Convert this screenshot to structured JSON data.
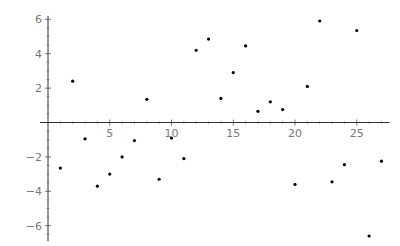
{
  "chart_data": {
    "type": "scatter",
    "title": "",
    "xlabel": "",
    "ylabel": "",
    "xlim": [
      0,
      27.5
    ],
    "ylim": [
      -6.9,
      6.2
    ],
    "grid": false,
    "legend": null,
    "x_ticks": [
      5,
      10,
      15,
      20,
      25
    ],
    "y_ticks": [
      -6,
      -4,
      -2,
      2,
      4,
      6
    ],
    "x_tick_labels": [
      "5",
      "10",
      "15",
      "20",
      "25"
    ],
    "y_tick_labels": [
      "−6",
      "−4",
      "−2",
      "2",
      "4",
      "6"
    ],
    "point_color": "#000000",
    "axis_color": "#333333",
    "tick_label_color": "#777777",
    "points": [
      {
        "x": 1,
        "y": -2.65
      },
      {
        "x": 2,
        "y": 2.4
      },
      {
        "x": 3,
        "y": -0.95
      },
      {
        "x": 4,
        "y": -3.7
      },
      {
        "x": 5,
        "y": -3.0
      },
      {
        "x": 6,
        "y": -2.0
      },
      {
        "x": 7,
        "y": -1.05
      },
      {
        "x": 8,
        "y": 1.35
      },
      {
        "x": 9,
        "y": -3.3
      },
      {
        "x": 10,
        "y": -0.9
      },
      {
        "x": 11,
        "y": -2.1
      },
      {
        "x": 12,
        "y": 4.2
      },
      {
        "x": 13,
        "y": 4.85
      },
      {
        "x": 14,
        "y": 1.4
      },
      {
        "x": 15,
        "y": 2.9
      },
      {
        "x": 16,
        "y": 4.45
      },
      {
        "x": 17,
        "y": 0.65
      },
      {
        "x": 18,
        "y": 1.2
      },
      {
        "x": 19,
        "y": 0.75
      },
      {
        "x": 20,
        "y": -3.6
      },
      {
        "x": 21,
        "y": 2.1
      },
      {
        "x": 22,
        "y": 5.9
      },
      {
        "x": 23,
        "y": -3.45
      },
      {
        "x": 24,
        "y": -2.45
      },
      {
        "x": 25,
        "y": 5.35
      },
      {
        "x": 26,
        "y": -6.6
      },
      {
        "x": 27,
        "y": -2.25
      }
    ]
  }
}
